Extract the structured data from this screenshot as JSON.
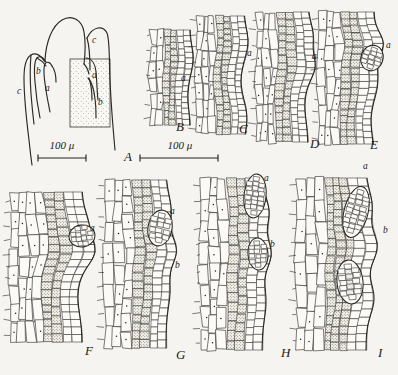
{
  "figure": {
    "background_color": "#f6f4f0",
    "ink_color": "#26251f",
    "stipple_color": "#efece3"
  },
  "scale_bars": [
    {
      "id": "scale-a",
      "label": "100 μ",
      "x": 38,
      "y": 158,
      "length": 48,
      "text_x": 62,
      "text_y": 146
    },
    {
      "id": "scale-bi",
      "label": "100 μ",
      "x": 140,
      "y": 158,
      "length": 78,
      "text_x": 180,
      "text_y": 146
    }
  ],
  "panels": [
    {
      "letter": "A",
      "label_x": 124,
      "label_y": 158,
      "type": "apex-outline",
      "description": "longitudinal outline of shoot apex with leaf primordia and stippled block",
      "parts": [
        {
          "label": "c",
          "x": 17,
          "y": 92
        },
        {
          "label": "b",
          "x": 36,
          "y": 72
        },
        {
          "label": "a",
          "x": 45,
          "y": 89
        },
        {
          "label": "c",
          "x": 92,
          "y": 41
        },
        {
          "label": "a",
          "x": 92,
          "y": 76
        },
        {
          "label": "b",
          "x": 98,
          "y": 103
        }
      ]
    },
    {
      "letter": "B",
      "label_x": 176,
      "label_y": 128,
      "type": "section",
      "parts": [
        {
          "label": "a",
          "x": 181,
          "y": 79
        }
      ]
    },
    {
      "letter": "C",
      "label_x": 239,
      "label_y": 130,
      "type": "section",
      "parts": [
        {
          "label": "a",
          "x": 247,
          "y": 54
        }
      ]
    },
    {
      "letter": "D",
      "label_x": 310,
      "label_y": 145,
      "type": "section",
      "parts": [
        {
          "label": "a",
          "x": 312,
          "y": 57
        }
      ]
    },
    {
      "letter": "E",
      "label_x": 370,
      "label_y": 146,
      "type": "section",
      "parts": [
        {
          "label": "a",
          "x": 386,
          "y": 46
        },
        {
          "label": "a",
          "x": 363,
          "y": 167
        }
      ]
    },
    {
      "letter": "F",
      "label_x": 85,
      "label_y": 352,
      "type": "section",
      "parts": [
        {
          "label": "a",
          "x": 90,
          "y": 229
        }
      ]
    },
    {
      "letter": "G",
      "label_x": 176,
      "label_y": 356,
      "type": "section",
      "parts": [
        {
          "label": "a",
          "x": 170,
          "y": 212
        },
        {
          "label": "b",
          "x": 175,
          "y": 266
        }
      ]
    },
    {
      "letter": "H",
      "label_x": 281,
      "label_y": 354,
      "type": "section",
      "parts": [
        {
          "label": "a",
          "x": 264,
          "y": 179
        },
        {
          "label": "b",
          "x": 270,
          "y": 245
        }
      ]
    },
    {
      "letter": "I",
      "label_x": 378,
      "label_y": 354,
      "type": "section",
      "parts": [
        {
          "label": "b",
          "x": 383,
          "y": 231
        }
      ]
    }
  ]
}
